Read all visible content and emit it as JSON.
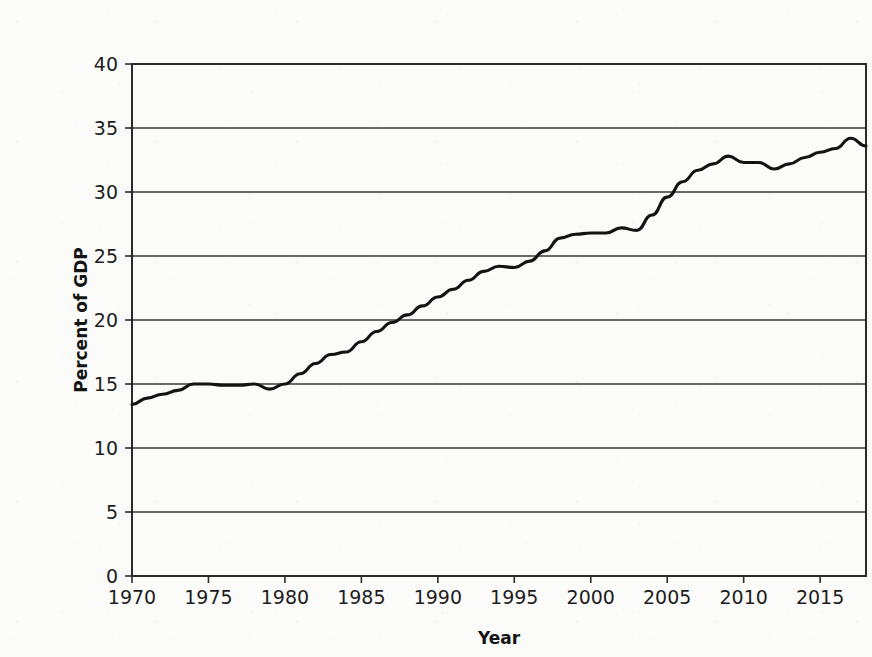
{
  "chart_data": {
    "type": "line",
    "title": "",
    "subtitle": "",
    "xlabel": "Year",
    "ylabel": "Percent of GDP",
    "xlim": [
      1970,
      2018
    ],
    "ylim": [
      0,
      40
    ],
    "grid": "horizontal",
    "legend": "none",
    "x_ticks": [
      "1970",
      "1975",
      "1980",
      "1985",
      "1990",
      "1995",
      "2000",
      "2005",
      "2010",
      "2015"
    ],
    "x_tick_values": [
      1970,
      1975,
      1980,
      1985,
      1990,
      1995,
      2000,
      2005,
      2010,
      2015
    ],
    "y_ticks": [
      "0",
      "5",
      "10",
      "15",
      "20",
      "25",
      "30",
      "35",
      "40"
    ],
    "y_tick_values": [
      0,
      5,
      10,
      15,
      20,
      25,
      30,
      35,
      40
    ],
    "series": [
      {
        "name": "Percent of GDP",
        "color": "#131313",
        "x": [
          1970,
          1971,
          1972,
          1973,
          1974,
          1975,
          1976,
          1977,
          1978,
          1979,
          1980,
          1981,
          1982,
          1983,
          1984,
          1985,
          1986,
          1987,
          1988,
          1989,
          1990,
          1991,
          1992,
          1993,
          1994,
          1995,
          1996,
          1997,
          1998,
          1999,
          2000,
          2001,
          2002,
          2003,
          2004,
          2005,
          2006,
          2007,
          2008,
          2009,
          2010,
          2011,
          2012,
          2013,
          2014,
          2015,
          2016,
          2017,
          2018
        ],
        "values": [
          13.4,
          13.9,
          14.2,
          14.5,
          15.0,
          15.0,
          14.9,
          14.9,
          15.0,
          14.6,
          15.0,
          15.8,
          16.6,
          17.3,
          17.5,
          18.3,
          19.1,
          19.8,
          20.4,
          21.1,
          21.8,
          22.4,
          23.1,
          23.8,
          24.2,
          24.1,
          24.6,
          25.4,
          26.4,
          26.7,
          26.8,
          26.8,
          27.2,
          27.0,
          28.2,
          29.6,
          30.8,
          31.7,
          32.2,
          32.8,
          32.3,
          32.3,
          31.8,
          32.2,
          32.7,
          33.1,
          33.4,
          34.2,
          33.6
        ],
        "start_value": 13.4,
        "end_value": 33.6,
        "min_value": 13.4,
        "max_value": 34.2,
        "max_year": 2017,
        "min_year": 1970
      }
    ]
  },
  "figure": {
    "background_color": "#fbfbfa",
    "line_color": "#131313",
    "axis_color": "#2b2b2b",
    "grid_color": "#3a3a3a"
  }
}
